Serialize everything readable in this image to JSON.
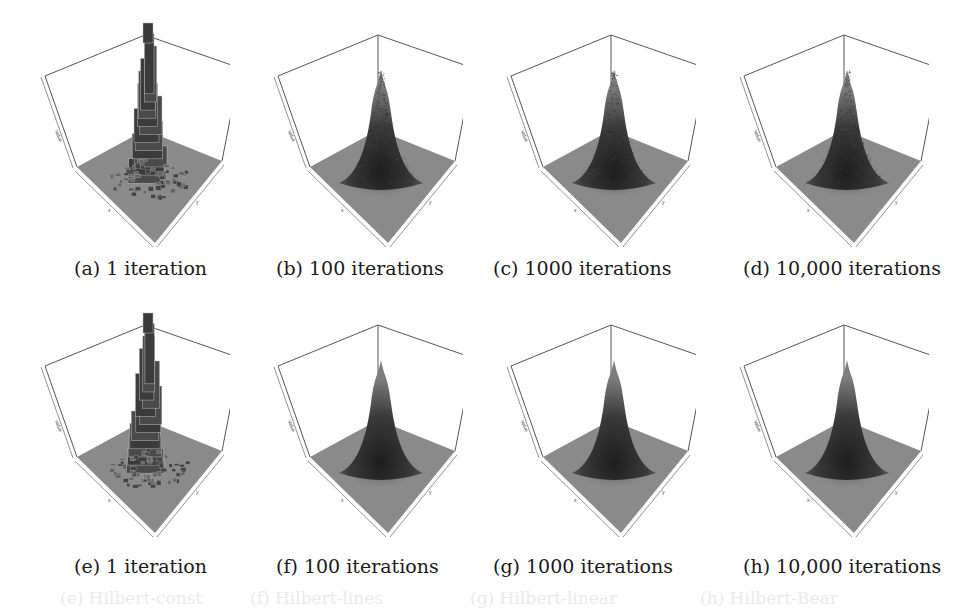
{
  "figure": {
    "rows": [
      {
        "row": 1,
        "panels": [
          {
            "id": "a",
            "label": "(a)",
            "caption": "1 iteration",
            "style": "histogram"
          },
          {
            "id": "b",
            "label": "(b)",
            "caption": "100 iterations",
            "style": "noisy"
          },
          {
            "id": "c",
            "label": "(c)",
            "caption": "1000 iterations",
            "style": "noisy"
          },
          {
            "id": "d",
            "label": "(d)",
            "caption": "10,000 iterations",
            "style": "noisy"
          }
        ]
      },
      {
        "row": 2,
        "panels": [
          {
            "id": "e",
            "label": "(e)",
            "caption": "1 iteration",
            "style": "histogram"
          },
          {
            "id": "f",
            "label": "(f)",
            "caption": "100 iterations",
            "style": "smooth"
          },
          {
            "id": "g",
            "label": "(g)",
            "caption": "1000 iterations",
            "style": "smooth"
          },
          {
            "id": "h",
            "label": "(h)",
            "caption": "10,000 iterations",
            "style": "smooth"
          }
        ]
      }
    ],
    "captions": {
      "a": "(a) 1 iteration",
      "b": "(b) 100 iterations",
      "c": "(c) 1000 iterations",
      "d": "(d) 10,000 iterations",
      "e": "(e) 1 iteration",
      "f": "(f) 100 iterations",
      "g": "(g) 1000 iterations",
      "h": "(h) 10,000 iterations"
    },
    "axes": {
      "z_label": "value",
      "x_label": "x",
      "y_label": "y"
    },
    "colors": {
      "floor": "#8a8a8a",
      "peak": "#2e2e2e",
      "box_line": "#555555",
      "text": "#1a1a1a"
    },
    "bleed_through": [
      "(e) Hilbert-const",
      "(f) Hilbert-lines",
      "(g) Hilbert-linear",
      "(h) Hilbert-Bear"
    ]
  }
}
